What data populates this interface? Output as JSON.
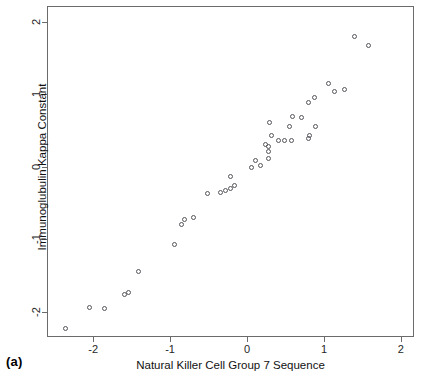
{
  "figure": {
    "panel_label": "(a)",
    "background_color": "#ffffff",
    "frame_color": "#6b6b6b",
    "point_color": "#55555b"
  },
  "chart_data": {
    "type": "scatter",
    "title": "",
    "xlabel": "Natural Killer Cell Group 7 Sequence",
    "ylabel": "Immunoglubulin Kappa Constant",
    "xlim": [
      -2.6,
      2.17
    ],
    "ylim": [
      -2.35,
      2.22
    ],
    "xticks": [
      -2,
      -1,
      0,
      1,
      2
    ],
    "xticklabels": [
      "-2",
      "-1",
      "0",
      "1",
      "2"
    ],
    "yticks": [
      -2,
      -1,
      0,
      1,
      2
    ],
    "yticklabels": [
      "-2",
      "-1",
      "0",
      "1",
      "2"
    ],
    "grid": false,
    "legend": null,
    "marker": "open-circle",
    "n_points": 40,
    "points": [
      {
        "x": -2.37,
        "y": -2.22
      },
      {
        "x": -2.06,
        "y": -1.93
      },
      {
        "x": -1.87,
        "y": -1.94
      },
      {
        "x": -1.61,
        "y": -1.75
      },
      {
        "x": -1.56,
        "y": -1.72
      },
      {
        "x": -1.43,
        "y": -1.43
      },
      {
        "x": -0.96,
        "y": -1.06
      },
      {
        "x": -0.86,
        "y": -0.78
      },
      {
        "x": -0.83,
        "y": -0.72
      },
      {
        "x": -0.71,
        "y": -0.68
      },
      {
        "x": -0.53,
        "y": -0.35
      },
      {
        "x": -0.36,
        "y": -0.34
      },
      {
        "x": -0.29,
        "y": -0.32
      },
      {
        "x": -0.23,
        "y": -0.29
      },
      {
        "x": -0.17,
        "y": -0.24
      },
      {
        "x": -0.23,
        "y": -0.12
      },
      {
        "x": 0.05,
        "y": 0.01
      },
      {
        "x": 0.16,
        "y": 0.03
      },
      {
        "x": 0.1,
        "y": 0.1
      },
      {
        "x": 0.26,
        "y": 0.13
      },
      {
        "x": 0.26,
        "y": 0.22
      },
      {
        "x": 0.27,
        "y": 0.29
      },
      {
        "x": 0.23,
        "y": 0.32
      },
      {
        "x": 0.39,
        "y": 0.37
      },
      {
        "x": 0.48,
        "y": 0.37
      },
      {
        "x": 0.57,
        "y": 0.37
      },
      {
        "x": 0.31,
        "y": 0.44
      },
      {
        "x": 0.54,
        "y": 0.57
      },
      {
        "x": 0.28,
        "y": 0.62
      },
      {
        "x": 0.79,
        "y": 0.4
      },
      {
        "x": 0.8,
        "y": 0.44
      },
      {
        "x": 0.88,
        "y": 0.57
      },
      {
        "x": 0.58,
        "y": 0.71
      },
      {
        "x": 0.69,
        "y": 0.69
      },
      {
        "x": 0.78,
        "y": 0.9
      },
      {
        "x": 0.87,
        "y": 0.97
      },
      {
        "x": 1.04,
        "y": 1.16
      },
      {
        "x": 1.12,
        "y": 1.06
      },
      {
        "x": 1.26,
        "y": 1.08
      },
      {
        "x": 1.39,
        "y": 1.81
      },
      {
        "x": 1.56,
        "y": 1.69
      }
    ]
  }
}
